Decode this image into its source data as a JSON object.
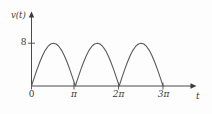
{
  "figure": {
    "background_color": "#fdfdfd",
    "line_color": "#5a5a5a",
    "axis_color": "#4a4a4a",
    "text_color": "#3a3a3a"
  },
  "labels": {
    "y_axis": "v(t)",
    "x_axis": "t",
    "y_tick_8": "8",
    "x_tick_0": "0",
    "x_tick_pi": "π",
    "x_tick_2pi": "2π",
    "x_tick_3pi": "3π"
  },
  "chart_data": {
    "type": "line",
    "title": "",
    "xlabel": "t",
    "ylabel": "v(t)",
    "xlim": [
      0,
      10.5
    ],
    "ylim": [
      0,
      10.5
    ],
    "grid": false,
    "legend": null,
    "function": "v(t) = 8|sin(t)|",
    "amplitude": 8,
    "period": 3.14159,
    "x_tick_values": [
      0,
      3.14159,
      6.28319,
      9.42478
    ],
    "x_tick_labels": [
      "0",
      "π",
      "2π",
      "3π"
    ],
    "y_tick_values": [
      8
    ],
    "y_tick_labels": [
      "8"
    ],
    "series": [
      {
        "name": "v(t)",
        "x": [
          0,
          0.19635,
          0.3927,
          0.58905,
          0.7854,
          0.98175,
          1.1781,
          1.37445,
          1.5708,
          1.76715,
          1.9635,
          2.15984,
          2.35619,
          2.55254,
          2.74889,
          2.94524,
          3.14159,
          3.33794,
          3.53429,
          3.73064,
          3.92699,
          4.12334,
          4.31969,
          4.51604,
          4.71239,
          4.90874,
          5.10509,
          5.30144,
          5.49779,
          5.69414,
          5.89049,
          6.08684,
          6.28319,
          6.47953,
          6.67588,
          6.87223,
          7.06858,
          7.26493,
          7.46128,
          7.65763,
          7.85398,
          8.05033,
          8.24668,
          8.44303,
          8.63938,
          8.83573,
          9.03208,
          9.22843,
          9.42478
        ],
        "y": [
          0,
          1.56,
          3.06,
          4.44,
          5.66,
          6.66,
          7.39,
          7.85,
          8,
          7.85,
          7.39,
          6.66,
          5.66,
          4.44,
          3.06,
          1.56,
          0,
          1.56,
          3.06,
          4.44,
          5.66,
          6.66,
          7.39,
          7.85,
          8,
          7.85,
          7.39,
          6.66,
          5.66,
          4.44,
          3.06,
          1.56,
          0,
          1.56,
          3.06,
          4.44,
          5.66,
          6.66,
          7.39,
          7.85,
          8,
          7.85,
          7.39,
          6.66,
          5.66,
          4.44,
          3.06,
          1.56,
          0
        ]
      }
    ]
  }
}
